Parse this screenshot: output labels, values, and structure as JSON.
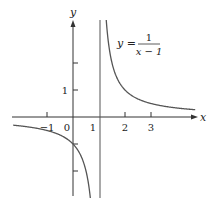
{
  "chart_data": {
    "type": "line",
    "title": "",
    "equation": {
      "lhs": "y =",
      "numerator": "1",
      "denominator": "x − 1"
    },
    "xlabel": "x",
    "ylabel": "y",
    "x_ticks": [
      {
        "value": -1,
        "label": "−1"
      },
      {
        "value": 0,
        "label": "0"
      },
      {
        "value": 1,
        "label": "1"
      },
      {
        "value": 2,
        "label": "2"
      },
      {
        "value": 3,
        "label": "3"
      }
    ],
    "y_ticks": [
      {
        "value": 1,
        "label": "1"
      },
      {
        "value": 2,
        "label": ""
      },
      {
        "value": -1,
        "label": ""
      },
      {
        "value": -2,
        "label": ""
      }
    ],
    "xlim": [
      -2.3,
      4.7
    ],
    "ylim": [
      -3.0,
      3.6
    ],
    "grid": false,
    "legend": null,
    "asymptotes": {
      "vertical_x": 1,
      "horizontal_y": 0
    },
    "series": [
      {
        "name": "y = 1/(x-1)",
        "function": "1/(x-1)",
        "points": [
          [
            -2.3,
            -0.3
          ],
          [
            -2,
            -0.33
          ],
          [
            -1,
            -0.5
          ],
          [
            0,
            -1
          ],
          [
            0.5,
            -2
          ],
          [
            0.7,
            -3.33
          ],
          [
            1.3,
            3.33
          ],
          [
            1.5,
            2
          ],
          [
            2,
            1
          ],
          [
            3,
            0.5
          ],
          [
            4,
            0.33
          ],
          [
            4.7,
            0.27
          ]
        ]
      }
    ],
    "colors": {
      "curve": "#555555",
      "axes": "#333333"
    }
  }
}
